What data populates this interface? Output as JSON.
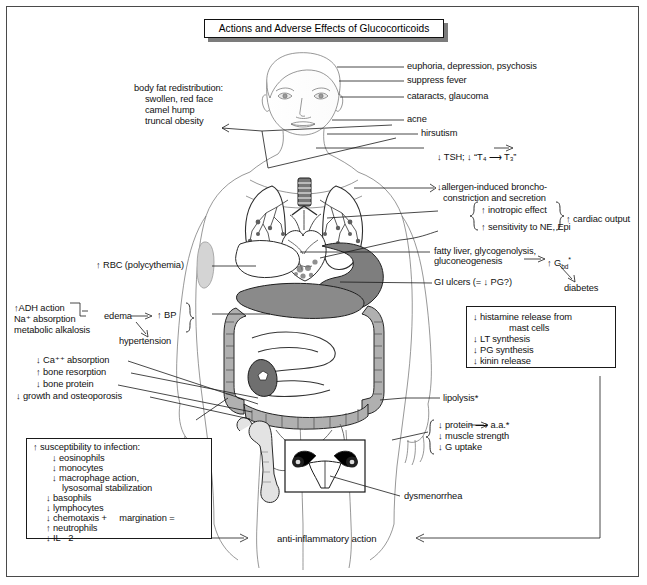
{
  "title": "Actions and Adverse Effects of Glucocorticoids",
  "head_effects": [
    "euphoria, depression, psychosis",
    "suppress fever",
    "cataracts, glaucoma",
    "acne",
    "hirsutism"
  ],
  "thyroid_line": "↓ TSH; ↓ “T₄ ⟶ T₃”",
  "body_fat": {
    "header": "body fat redistribution:",
    "items": [
      "swollen, red face",
      "camel hump",
      "truncal obesity"
    ]
  },
  "respiratory": {
    "line1": "↓allergen-induced broncho-",
    "line2": "constriction and secretion"
  },
  "cardiac": {
    "item1": "↑ inotropic effect",
    "item2": "↑ sensitivity to NE, Epi",
    "result": "↑ cardiac output"
  },
  "hepatic": {
    "line1": "fatty liver, glycogenolysis,",
    "line2": "gluconeogenesis",
    "arrow_result": "↑ G",
    "arrow_result_sub": "bd",
    "arrow_result_star": "*",
    "diabetes": "diabetes"
  },
  "gi_ulcers": "GI ulcers (= ↓ PG?)",
  "rbc": "↑ RBC (polycythemia)",
  "renal": {
    "item1": "↑ADH action",
    "item2": "Na⁺ absorption",
    "item3": "metabolic alkalosis",
    "edema": "edema",
    "bp": "↑ BP",
    "hypertension": "hypertension"
  },
  "bone": {
    "item1": "↓ Ca⁺⁺ absorption",
    "item2": "↑ bone resorption",
    "item3": "↓ bone protein",
    "item4": "↓ growth and osteoporosis"
  },
  "mast_box": {
    "line1": "↓ histamine release from",
    "line2": "mast cells",
    "line3": "↓ LT synthesis",
    "line4": "↓ PG synthesis",
    "line5": "↓ kinin release"
  },
  "lipolysis": "lipolysis*",
  "muscle": {
    "item1": "↓ protein ⟶ a.a.*",
    "item2": "↓ muscle strength",
    "item3": "↓ G uptake"
  },
  "dysmenorrhea": "dysmenorrhea",
  "infection_box": {
    "header": "↑ susceptibility to infection:",
    "items": [
      "↓ eosinophils",
      "↓ monocytes",
      "↓ macrophage action,",
      "lysosomal stabilization",
      "↓ basophils",
      "↓ lymphocytes",
      "↓ chemotaxis +     margination =",
      "↑ neutrophils",
      "↓ IL - 2"
    ]
  },
  "footer": "anti-inflammatory action",
  "colors": {
    "frame": "#4a4a4a",
    "ink": "#111111",
    "organ_mid": "#8c8c8c",
    "organ_dark": "#5a5a5a",
    "organ_light": "#c9c9c9"
  }
}
